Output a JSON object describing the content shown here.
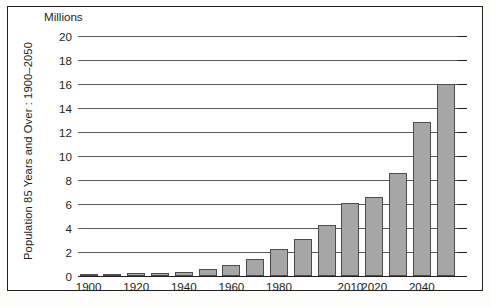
{
  "figure": {
    "units_caption": "Millions",
    "y_axis_title": "Population 85 Years and Over : 1900–2050"
  },
  "chart_data": {
    "type": "bar",
    "title": "",
    "subtitle": "",
    "xlabel": "",
    "ylabel": "Population 85 Years and Over : 1900–2050",
    "units": "Millions",
    "grid": true,
    "legend": "none",
    "ylim": [
      0,
      20
    ],
    "ytick_values": [
      0,
      2,
      4,
      6,
      8,
      10,
      12,
      14,
      16,
      18,
      20
    ],
    "ytick_labels": [
      "0",
      "2",
      "4",
      "6",
      "8",
      "10",
      "12",
      "14",
      "16",
      "18",
      "20"
    ],
    "xtick_labels": [
      "1900",
      "1920",
      "1940",
      "1960",
      "1980",
      "2010",
      "2020",
      "2040"
    ],
    "xtick_categories": [
      "1900",
      "1920",
      "1940",
      "1960",
      "1980",
      "2010",
      "2020",
      "2040"
    ],
    "categories": [
      "1900",
      "1910",
      "1920",
      "1930",
      "1940",
      "1950",
      "1960",
      "1970",
      "1980",
      "1990",
      "2000",
      "2010",
      "2020",
      "2030",
      "2040",
      "2050"
    ],
    "values": [
      0.12,
      0.17,
      0.21,
      0.27,
      0.37,
      0.58,
      0.94,
      1.41,
      2.24,
      3.08,
      4.27,
      6.12,
      6.6,
      8.6,
      12.8,
      16.0
    ],
    "series": [
      {
        "name": "Population 85 Years and Over",
        "values": [
          0.12,
          0.17,
          0.21,
          0.27,
          0.37,
          0.58,
          0.94,
          1.41,
          2.24,
          3.08,
          4.27,
          6.12,
          6.6,
          8.6,
          12.8,
          16.0
        ]
      }
    ],
    "bar_color": "#a6a6a6",
    "bar_edge_color": "#4d4d4f",
    "axis_color": "#231f20",
    "grid_color": "#58595b"
  }
}
